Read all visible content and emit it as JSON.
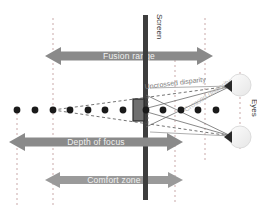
{
  "figure": {
    "kind": "stereoscopic-viewing-comfort-diagram",
    "width": 257,
    "height": 212,
    "background": "#ffffff"
  },
  "labels": {
    "screen": "Screen",
    "eyes": "Eyes",
    "uncrossed_disparity": "Uncrossed disparity",
    "crossed_disparity": "Crossed disparity"
  },
  "bars": [
    {
      "id": "fusion-range",
      "label": "Fusion range",
      "color": "#8a8a8a",
      "x_start": 53,
      "x_end": 205,
      "y_center": 56,
      "thickness": 13
    },
    {
      "id": "depth-of-focus",
      "label": "Depth of focus",
      "color": "#8a8a8a",
      "x_start": 17,
      "x_end": 175,
      "y_center": 142,
      "thickness": 13
    },
    {
      "id": "comfort-zone",
      "label": "Comfort zone",
      "color": "#9a9a9a",
      "x_start": 53,
      "x_end": 175,
      "y_center": 180,
      "thickness": 12
    }
  ],
  "screen": {
    "x": 145,
    "y_top": 15,
    "y_bottom": 200,
    "width": 5,
    "color": "#3d3d3d"
  },
  "stimulus_box": {
    "x": 133,
    "y": 98,
    "width": 12,
    "height": 22,
    "fill": "#6f6f6f",
    "stroke": "#2b2b2b"
  },
  "eyes": [
    {
      "id": "eye-top",
      "cx": 240,
      "cy": 85,
      "r": 11
    },
    {
      "id": "eye-bottom",
      "cx": 240,
      "cy": 137,
      "r": 11
    }
  ],
  "pupils": [
    {
      "id": "pupil-top",
      "cx": 229,
      "cy": 86
    },
    {
      "id": "pupil-bottom",
      "cx": 229,
      "cy": 136
    }
  ],
  "dot_row": {
    "y": 110,
    "radius": 3.4,
    "color": "#1a1a1a",
    "x_positions": [
      17,
      35,
      53,
      70,
      88,
      105,
      123,
      146,
      163,
      181,
      198,
      216
    ]
  },
  "guide_lines": {
    "color": "#c9a9a9",
    "dash": "2,3",
    "x_positions": [
      17,
      53,
      175,
      205
    ],
    "y_top": 18,
    "y_bottom": 205
  },
  "rays": {
    "uncrossed_color": "#5d5d5d",
    "crossed_color": "#6b6b6b",
    "uncrossed_style": "dashed",
    "crossed_style": "solid",
    "converge_x": 53
  },
  "colors": {
    "arrow_gray": "#8a8a8a",
    "screen_dark": "#3d3d3d",
    "dot_black": "#1a1a1a",
    "guide_pink": "#c9a9a9",
    "label_white": "#f2f2f2"
  }
}
